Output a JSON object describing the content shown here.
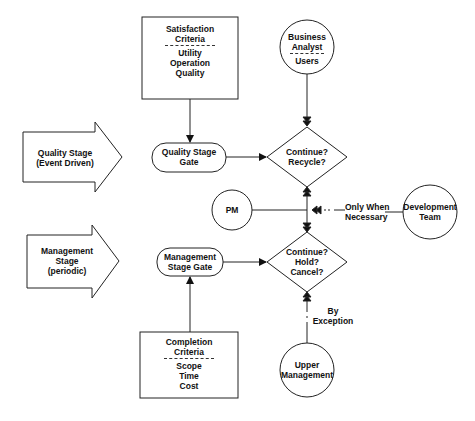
{
  "diagram": {
    "satisfaction_criteria": {
      "title_line1": "Satisfaction",
      "title_line2": "Criteria",
      "items": [
        "Utility",
        "Operation",
        "Quality"
      ]
    },
    "business_analyst": {
      "line1": "Business",
      "line2": "Analyst",
      "line3": "Users"
    },
    "quality_stage": {
      "line1": "Quality Stage",
      "line2": "(Event Driven)"
    },
    "quality_gate": {
      "line1": "Quality Stage",
      "line2": "Gate"
    },
    "decision_quality": {
      "line1": "Continue?",
      "line2": "Recycle?"
    },
    "pm": {
      "label": "PM"
    },
    "only_when": {
      "line1": "Only When",
      "line2": "Necessary"
    },
    "development_team": {
      "line1": "Development",
      "line2": "Team"
    },
    "management_stage": {
      "line1": "Management",
      "line2": "Stage",
      "line3": "(periodic)"
    },
    "management_gate": {
      "line1": "Management",
      "line2": "Stage Gate"
    },
    "decision_management": {
      "line1": "Continue?",
      "line2": "Hold?",
      "line3": "Cancel?"
    },
    "by_exception": {
      "line1": "By",
      "line2": "Exception"
    },
    "completion_criteria": {
      "title_line1": "Completion",
      "title_line2": "Criteria",
      "items": [
        "Scope",
        "Time",
        "Cost"
      ]
    },
    "upper_management": {
      "line1": "Upper",
      "line2": "Management"
    }
  }
}
